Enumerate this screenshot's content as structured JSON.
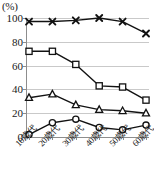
{
  "chart_data": {
    "type": "line",
    "title": "",
    "subtitle": "",
    "xlabel": "",
    "ylabel": "",
    "unit_label": "(%)",
    "categories": [
      "10歳代",
      "20歳代",
      "30歳代",
      "40歳代",
      "50歳代",
      "60歳代"
    ],
    "ylim": [
      0,
      100
    ],
    "yticks": [
      0,
      20,
      40,
      60,
      80,
      100
    ],
    "ytick_labels": [
      "0",
      "20",
      "40",
      "60",
      "80",
      "100"
    ],
    "grid": true,
    "grid_axis": "y",
    "legend": "none",
    "series": [
      {
        "name": "series-cross",
        "marker": "cross-icon",
        "color": "#121212",
        "values": [
          97,
          97,
          98,
          100,
          97,
          87
        ]
      },
      {
        "name": "series-square",
        "marker": "square-icon",
        "color": "#121212",
        "values": [
          72,
          72,
          61,
          43,
          42,
          31
        ]
      },
      {
        "name": "series-triangle",
        "marker": "triangle-icon",
        "color": "#121212",
        "values": [
          33,
          36,
          27,
          23,
          22,
          20
        ]
      },
      {
        "name": "series-circle",
        "marker": "circle-icon",
        "color": "#121212",
        "values": [
          2,
          12,
          15,
          8,
          6,
          10
        ]
      }
    ]
  },
  "axes": {
    "unit": "(%)",
    "grid_color": "#c9c9c9",
    "axis_color": "#8d8d8d"
  },
  "legend_cutoff": {
    "visible_fragments": [
      "",
      "",
      "",
      ""
    ]
  }
}
